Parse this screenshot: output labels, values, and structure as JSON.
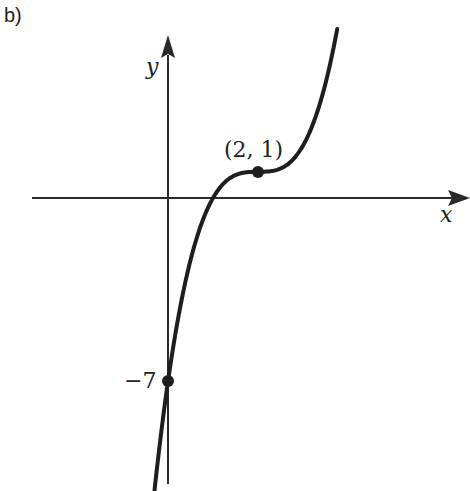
{
  "panel_label": "b)",
  "chart_data": {
    "type": "line",
    "title": "",
    "function": "y = (x - 2)^3 + 1",
    "xlabel": "x",
    "ylabel": "y",
    "grid": false,
    "legend": null,
    "xlim": [
      -3.0,
      6.7
    ],
    "ylim": [
      -11.3,
      6.9
    ],
    "series": [
      {
        "name": "f(x)",
        "x": [
          -0.28,
          0,
          0.5,
          1,
          1.5,
          2,
          2.5,
          3,
          3.5,
          3.75
        ],
        "y": [
          -10.85,
          -7,
          -2.375,
          0,
          0.875,
          1,
          1.125,
          2,
          4.375,
          6.36
        ]
      }
    ],
    "annotations": [
      {
        "label": "(2, 1)",
        "x": 2,
        "y": 1,
        "marker": "dot"
      },
      {
        "label": "−7",
        "x": 0,
        "y": -7,
        "marker": "dot"
      }
    ]
  },
  "labels": {
    "x_axis": "x",
    "y_axis": "y",
    "point_label": "(2, 1)",
    "intercept_label": "−7"
  },
  "colors": {
    "curve": "#1e1e1e",
    "axes": "#2a2a2a",
    "background": "#ffffff"
  }
}
